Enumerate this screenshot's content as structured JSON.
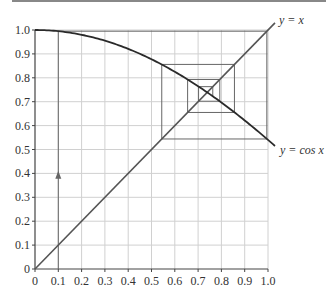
{
  "chart_data": {
    "type": "line",
    "title": "",
    "xlabel": "",
    "ylabel": "",
    "xlim": [
      0,
      1.0
    ],
    "ylim": [
      0,
      1.0
    ],
    "grid": true,
    "x_ticks": [
      "0",
      "0.1",
      "0.2",
      "0.3",
      "0.4",
      "0.5",
      "0.6",
      "0.7",
      "0.8",
      "0.9",
      "1.0"
    ],
    "y_ticks": [
      "0",
      "0.1",
      "0.2",
      "0.3",
      "0.4",
      "0.5",
      "0.6",
      "0.7",
      "0.8",
      "0.9",
      "1.0"
    ],
    "series": [
      {
        "name": "y = x",
        "label": "y = x",
        "function": "x",
        "x": [
          0,
          1.0
        ],
        "y": [
          0,
          1.0
        ]
      },
      {
        "name": "y = cos x",
        "label": "y = cos x",
        "function": "cos(x)",
        "x": [
          0,
          0.1,
          0.2,
          0.3,
          0.4,
          0.5,
          0.6,
          0.7,
          0.8,
          0.9,
          1.0
        ],
        "y": [
          1.0,
          0.995,
          0.98,
          0.955,
          0.921,
          0.878,
          0.825,
          0.765,
          0.697,
          0.622,
          0.54
        ]
      },
      {
        "name": "cobweb iteration",
        "start_x": 0.1,
        "iterates": [
          0.1,
          0.995,
          0.544,
          0.856,
          0.655,
          0.793,
          0.702,
          0.763,
          0.723
        ]
      }
    ],
    "annotations": [
      {
        "type": "arrow",
        "x": 0.1,
        "y": 0.39,
        "direction": "up"
      }
    ]
  },
  "labels": {
    "line_label": "y = x",
    "curve_label": "y = cos x"
  },
  "colors": {
    "curve": "#2a2a2a",
    "line": "#555555",
    "cobweb": "#666666",
    "grid": "#d0d0d0",
    "axis": "#444444"
  }
}
